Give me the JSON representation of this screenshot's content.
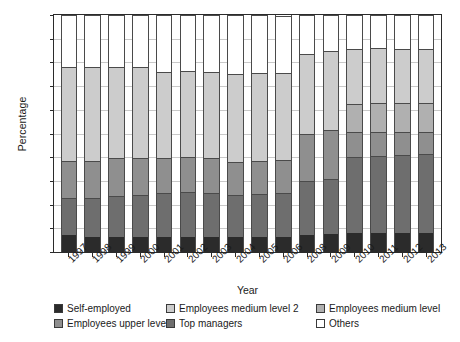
{
  "chart_data": {
    "type": "bar",
    "subtype": "stacked-vertical",
    "title": "",
    "xlabel": "Year",
    "ylabel": "Percentage",
    "ylim": [
      0,
      100
    ],
    "yticks": [
      0,
      10,
      20,
      30,
      40,
      50,
      60,
      70,
      80,
      90,
      100
    ],
    "grid": true,
    "legend_position": "bottom",
    "categories": [
      "1997",
      "1998",
      "1999",
      "2000",
      "2001",
      "2002",
      "2003",
      "2004",
      "2005",
      "2006",
      "2008",
      "2009",
      "2010",
      "2011",
      "2012",
      "2013"
    ],
    "series": [
      {
        "name": "Self-employed",
        "color": "#2b2b2b",
        "values": [
          7,
          6.5,
          6.5,
          6.5,
          6.5,
          6.5,
          6.5,
          6.5,
          6.5,
          6.5,
          7,
          7.5,
          8,
          8,
          8,
          8
        ]
      },
      {
        "name": "Top managers",
        "color": "#6e6e6e",
        "values": [
          16,
          16.5,
          17,
          17.5,
          18.5,
          19,
          18.5,
          17.5,
          18,
          18.5,
          23,
          23.5,
          32,
          32.5,
          33,
          33.5
        ]
      },
      {
        "name": "Employees upper level",
        "color": "#8f8f8f",
        "values": [
          15.5,
          15.5,
          16,
          15.5,
          14.5,
          14.5,
          14.5,
          14,
          14,
          14,
          20,
          20.5,
          10.5,
          10,
          9.5,
          9
        ]
      },
      {
        "name": "Employees medium level",
        "color": "#b0b0b0",
        "values": [
          0,
          0,
          0,
          0,
          0,
          0,
          0,
          0,
          0,
          0,
          0,
          0,
          12,
          12.5,
          12.5,
          12.5
        ]
      },
      {
        "name": "Employees medium level 2",
        "color": "#cccccc",
        "values": [
          39.5,
          39.5,
          38.5,
          38.5,
          36.5,
          36.5,
          36.5,
          37,
          37,
          36.5,
          33.5,
          33.5,
          23,
          23,
          22.5,
          22.5
        ]
      },
      {
        "name": "Others",
        "color": "#ffffff",
        "values": [
          22,
          22,
          22,
          22,
          24,
          23.5,
          24,
          25,
          24.5,
          24,
          16.5,
          15,
          14.5,
          14,
          14.5,
          14.5
        ]
      }
    ],
    "totals_visible": [
      78,
      78,
      78,
      78,
      76,
      76.5,
      76,
      75,
      75.5,
      76,
      83.5,
      85,
      85.5,
      86,
      85.5,
      85.5
    ]
  },
  "legend": {
    "items": [
      {
        "label": "Self-employed"
      },
      {
        "label": "Employees upper level"
      },
      {
        "label": "Employees medium level 2"
      },
      {
        "label": "Top managers"
      },
      {
        "label": "Employees medium level"
      },
      {
        "label": "Others"
      }
    ]
  }
}
